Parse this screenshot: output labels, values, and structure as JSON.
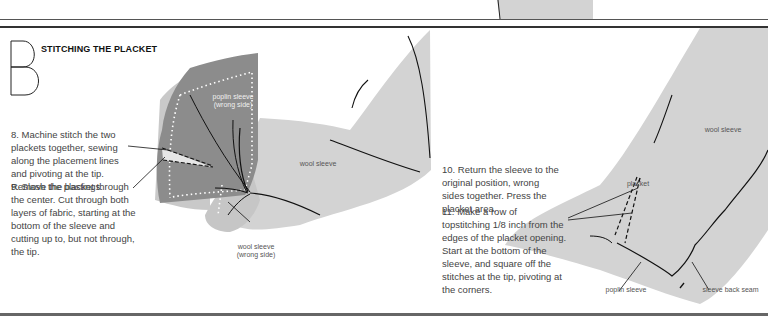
{
  "section": {
    "letter": "B",
    "title": "STITCHING THE PLACKET"
  },
  "steps": [
    {
      "number": "8",
      "text": "8. Machine stitch the two plackets together, sewing along the placement lines and pivoting at the tip. Remove the bastings."
    },
    {
      "number": "9",
      "text": "9. Slash the placket through the center. Cut through both layers of fabric, starting at the bottom of the sleeve and cutting up to, but not through, the tip."
    },
    {
      "number": "10",
      "text": "10. Return the sleeve to the original position, wrong sides together. Press the placket area."
    },
    {
      "number": "11",
      "text": "11. Make a row of topstitching 1/8 inch from the edges of the placket opening. Start at the bottom of the sleeve, and square off the stitches at the tip, pivoting at the corners."
    }
  ],
  "labels": {
    "poplin_wrong_1": "poplin sleeve",
    "poplin_wrong_2": "(wrong side)",
    "wool_sleeve_left": "wool sleeve",
    "wool_wrong_1": "wool sleeve",
    "wool_wrong_2": "(wrong side)",
    "wool_sleeve_right": "wool sleeve",
    "placket": "placket",
    "poplin_sleeve": "poplin sleeve",
    "sleeve_back_seam": "sleeve back seam"
  },
  "colors": {
    "fabric_light": "#d3d3d3",
    "fabric_dark": "#8c8c8c",
    "stitch_line": "#1a1a1a",
    "basting_dots": "#ffffff"
  }
}
